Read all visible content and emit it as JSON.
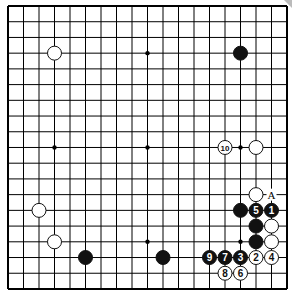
{
  "board": {
    "size": 19,
    "origin_x": 8,
    "origin_y": 6,
    "step_x": 15.5,
    "step_y": 15.72,
    "line_color": "#000000",
    "star_points": [
      [
        3,
        3
      ],
      [
        9,
        3
      ],
      [
        15,
        3
      ],
      [
        3,
        9
      ],
      [
        9,
        9
      ],
      [
        15,
        9
      ],
      [
        3,
        15
      ],
      [
        9,
        15
      ],
      [
        15,
        15
      ]
    ]
  },
  "stones": [
    {
      "color": "white",
      "col": 3,
      "row": 3,
      "label": ""
    },
    {
      "color": "black",
      "col": 15,
      "row": 3,
      "label": ""
    },
    {
      "color": "white",
      "col": 14,
      "row": 9,
      "label": "10"
    },
    {
      "color": "white",
      "col": 16,
      "row": 9,
      "label": ""
    },
    {
      "color": "white",
      "col": 2,
      "row": 13,
      "label": ""
    },
    {
      "color": "white",
      "col": 3,
      "row": 15,
      "label": ""
    },
    {
      "color": "black",
      "col": 5,
      "row": 16,
      "label": ""
    },
    {
      "color": "black",
      "col": 10,
      "row": 16,
      "label": ""
    },
    {
      "color": "white",
      "col": 16,
      "row": 12,
      "label": ""
    },
    {
      "color": "black",
      "col": 15,
      "row": 13,
      "label": ""
    },
    {
      "color": "black",
      "col": 16,
      "row": 13,
      "label": "5"
    },
    {
      "color": "black",
      "col": 17,
      "row": 13,
      "label": "1"
    },
    {
      "color": "black",
      "col": 16,
      "row": 14,
      "label": ""
    },
    {
      "color": "white",
      "col": 17,
      "row": 14,
      "label": ""
    },
    {
      "color": "black",
      "col": 16,
      "row": 15,
      "label": ""
    },
    {
      "color": "white",
      "col": 17,
      "row": 15,
      "label": ""
    },
    {
      "color": "black",
      "col": 13,
      "row": 16,
      "label": "9"
    },
    {
      "color": "black",
      "col": 14,
      "row": 16,
      "label": "7"
    },
    {
      "color": "black",
      "col": 15,
      "row": 16,
      "label": "3"
    },
    {
      "color": "white",
      "col": 16,
      "row": 16,
      "label": "2"
    },
    {
      "color": "white",
      "col": 17,
      "row": 16,
      "label": "4"
    },
    {
      "color": "white",
      "col": 14,
      "row": 17,
      "label": "8"
    },
    {
      "color": "white",
      "col": 15,
      "row": 17,
      "label": "6"
    }
  ],
  "markers": [
    {
      "col": 17,
      "row": 12,
      "text": "A"
    }
  ]
}
